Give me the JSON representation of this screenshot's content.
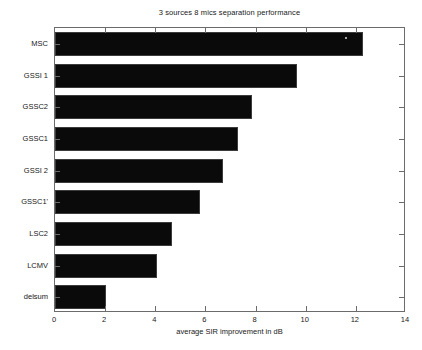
{
  "chart_data": {
    "type": "bar",
    "orientation": "horizontal",
    "title": "3 sources 8 mics separation performance",
    "xlabel": "average SIR improvement in dB",
    "ylabel": "",
    "categories": [
      "MSC",
      "GSSI 1",
      "GSSC2",
      "GSSC1",
      "GSSI 2",
      "GSSC1'",
      "LSC2",
      "LCMV",
      "delsum"
    ],
    "values": [
      12.3,
      9.65,
      7.85,
      7.3,
      6.7,
      5.8,
      4.65,
      4.05,
      2.05
    ],
    "xlim": [
      0,
      14
    ],
    "xticks": [
      0,
      2,
      4,
      6,
      8,
      10,
      12,
      14
    ],
    "xtick_labels": [
      "0",
      "2",
      "4",
      "6",
      "8",
      "10",
      "12",
      "14"
    ],
    "grid": false,
    "legend": null,
    "bar_color": "#0a0a0a",
    "axis_color": "#6b6b6b",
    "background": "#ffffff"
  }
}
